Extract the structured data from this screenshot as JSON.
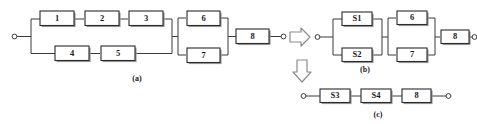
{
  "figure": {
    "width": 477,
    "height": 124,
    "background": "#ffffff",
    "line_color": "#3a3a3a",
    "box_stroke": "#2b2b2b",
    "box_fill": "#ffffff",
    "shadow_color": "#9a9a9a",
    "arrow_stroke": "#8c8c8c"
  },
  "diagrams": {
    "a": {
      "caption": "(a)",
      "blocks": [
        {
          "id": "a1",
          "label": "1"
        },
        {
          "id": "a2",
          "label": "2"
        },
        {
          "id": "a3",
          "label": "3"
        },
        {
          "id": "a4",
          "label": "4"
        },
        {
          "id": "a5",
          "label": "5"
        },
        {
          "id": "a6",
          "label": "6"
        },
        {
          "id": "a7",
          "label": "7"
        },
        {
          "id": "a8",
          "label": "8"
        }
      ]
    },
    "b": {
      "caption": "(b)",
      "blocks": [
        {
          "id": "bS1",
          "label": "S1"
        },
        {
          "id": "bS2",
          "label": "S2"
        },
        {
          "id": "b6",
          "label": "6"
        },
        {
          "id": "b7",
          "label": "7"
        },
        {
          "id": "b8",
          "label": "8"
        }
      ]
    },
    "c": {
      "caption": "(c)",
      "blocks": [
        {
          "id": "cS3",
          "label": "S3"
        },
        {
          "id": "cS4",
          "label": "S4"
        },
        {
          "id": "c8",
          "label": "8"
        }
      ]
    }
  },
  "arrows": {
    "right": "right-arrow",
    "down": "down-arrow"
  }
}
